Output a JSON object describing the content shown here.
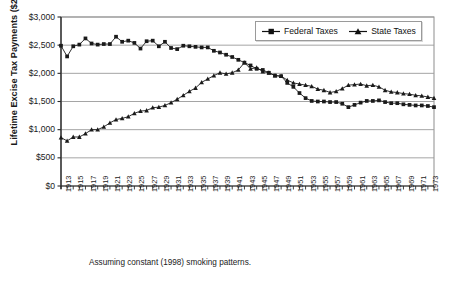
{
  "chart_data": {
    "type": "line",
    "title": "",
    "subtitle": "",
    "xlabel": "",
    "ylabel": "Lifetime Excise Tax Payments ($2000)",
    "caption": "Assuming constant (1998) smoking patterns.",
    "grid": true,
    "legend_position": "top-right",
    "xlim": [
      1913,
      1974
    ],
    "ylim": [
      0,
      3000
    ],
    "ytick_labels": [
      "$0",
      "$500",
      "$1,000",
      "$1,500",
      "$2,000",
      "$2,500",
      "$3,000"
    ],
    "ytick_values": [
      0,
      500,
      1000,
      1500,
      2000,
      2500,
      3000
    ],
    "xtick_labels": [
      "1913",
      "1915",
      "1917",
      "1919",
      "1921",
      "1923",
      "1925",
      "1927",
      "1929",
      "1931",
      "1933",
      "1935",
      "1937",
      "1939",
      "1941",
      "1943",
      "1945",
      "1947",
      "1949",
      "1951",
      "1953",
      "1955",
      "1957",
      "1959",
      "1961",
      "1963",
      "1965",
      "1967",
      "1969",
      "1971",
      "1973"
    ],
    "x": [
      1913,
      1914,
      1915,
      1916,
      1917,
      1918,
      1919,
      1920,
      1921,
      1922,
      1923,
      1924,
      1925,
      1926,
      1927,
      1928,
      1929,
      1930,
      1931,
      1932,
      1933,
      1934,
      1935,
      1936,
      1937,
      1938,
      1939,
      1940,
      1941,
      1942,
      1943,
      1944,
      1945,
      1946,
      1947,
      1948,
      1949,
      1950,
      1951,
      1952,
      1953,
      1954,
      1955,
      1956,
      1957,
      1958,
      1959,
      1960,
      1961,
      1962,
      1963,
      1964,
      1965,
      1966,
      1967,
      1968,
      1969,
      1970,
      1971,
      1972,
      1973,
      1974
    ],
    "series": [
      {
        "name": "Federal Taxes",
        "marker": "square",
        "color": "#1a1a1a",
        "values": [
          2490,
          2300,
          2480,
          2510,
          2620,
          2530,
          2510,
          2520,
          2520,
          2650,
          2560,
          2580,
          2540,
          2440,
          2570,
          2580,
          2480,
          2560,
          2450,
          2430,
          2490,
          2480,
          2470,
          2460,
          2460,
          2400,
          2370,
          2330,
          2290,
          2240,
          2190,
          2140,
          2080,
          2060,
          2010,
          1960,
          1950,
          1830,
          1760,
          1650,
          1560,
          1510,
          1500,
          1500,
          1490,
          1490,
          1460,
          1400,
          1440,
          1480,
          1510,
          1510,
          1520,
          1490,
          1470,
          1470,
          1450,
          1440,
          1430,
          1430,
          1420,
          1400
        ]
      },
      {
        "name": "State Taxes",
        "marker": "triangle",
        "color": "#1a1a1a",
        "values": [
          860,
          800,
          870,
          870,
          930,
          1000,
          1000,
          1050,
          1120,
          1180,
          1200,
          1230,
          1290,
          1330,
          1340,
          1390,
          1400,
          1430,
          1480,
          1540,
          1610,
          1680,
          1740,
          1840,
          1900,
          1960,
          2010,
          1990,
          2010,
          2060,
          2190,
          2080,
          2100,
          2030,
          2010,
          1960,
          1950,
          1880,
          1830,
          1810,
          1790,
          1770,
          1720,
          1700,
          1660,
          1680,
          1730,
          1790,
          1800,
          1810,
          1780,
          1790,
          1760,
          1700,
          1670,
          1660,
          1640,
          1630,
          1610,
          1600,
          1580,
          1560
        ]
      }
    ]
  },
  "legend": {
    "items": [
      {
        "label": "Federal Taxes"
      },
      {
        "label": "State Taxes"
      }
    ]
  }
}
